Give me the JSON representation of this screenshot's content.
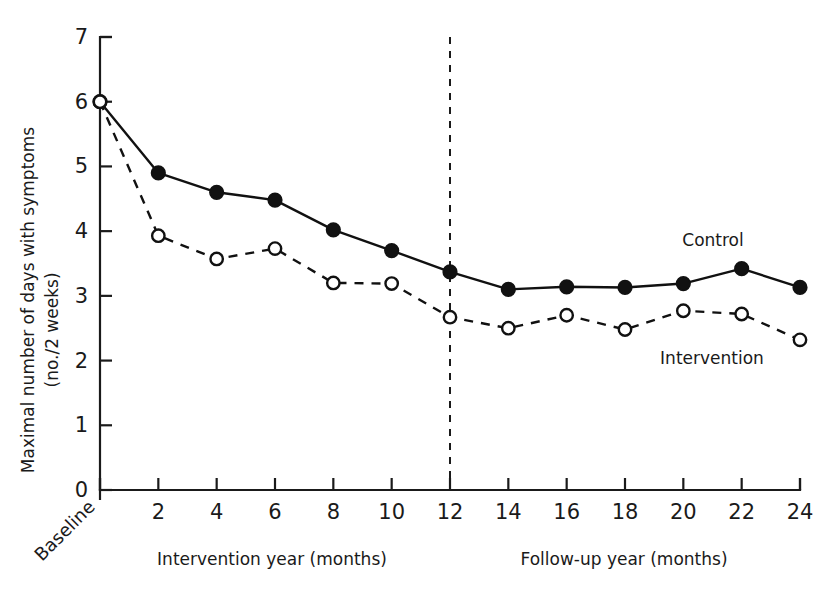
{
  "chart_data": {
    "type": "line",
    "title": "",
    "xlabel": "",
    "ylabel": "Maximal number of days with symptoms (no./2 weeks)",
    "ylabel_line1": "Maximal number of days with symptoms",
    "ylabel_line2": "(no./2 weeks)",
    "ylim": [
      0,
      7
    ],
    "yticks": [
      0,
      1,
      2,
      3,
      4,
      5,
      6,
      7
    ],
    "ytick_labels": [
      "0",
      "1",
      "2",
      "3",
      "4",
      "5",
      "6",
      "7"
    ],
    "xlim": [
      0,
      24
    ],
    "xticks": [
      0,
      2,
      4,
      6,
      8,
      10,
      12,
      14,
      16,
      18,
      20,
      22,
      24
    ],
    "xtick_labels": [
      "Baseline",
      "2",
      "4",
      "6",
      "8",
      "10",
      "12",
      "14",
      "16",
      "18",
      "20",
      "22",
      "24"
    ],
    "x": [
      0,
      2,
      4,
      6,
      8,
      10,
      12,
      14,
      16,
      18,
      20,
      22,
      24
    ],
    "grid": false,
    "legend_position": "inline-right",
    "series": [
      {
        "name": "Control",
        "marker": "filled-circle",
        "line_style": "solid",
        "color": "#111111",
        "values": [
          6.0,
          4.9,
          4.6,
          4.48,
          4.02,
          3.7,
          3.37,
          3.1,
          3.14,
          3.13,
          3.19,
          3.42,
          3.13
        ]
      },
      {
        "name": "Intervention",
        "marker": "open-circle",
        "line_style": "dashed",
        "color": "#111111",
        "values": [
          6.0,
          3.93,
          3.57,
          3.73,
          3.2,
          3.19,
          2.67,
          2.5,
          2.7,
          2.48,
          2.77,
          2.72,
          2.32
        ]
      }
    ],
    "annotations": [
      {
        "text": "Control",
        "x": 21.0,
        "y": 3.95
      },
      {
        "text": "Intervention",
        "x": 20.6,
        "y": 1.85
      }
    ],
    "x_axis_segments": [
      {
        "label": "Intervention year (months)",
        "from": 0,
        "to": 12
      },
      {
        "label": "Follow-up year (months)",
        "from": 12,
        "to": 24
      }
    ],
    "divider": {
      "at_x": 12,
      "style": "dashed"
    }
  },
  "labels": {
    "baseline": "Baseline",
    "intervention_axis": "Intervention year (months)",
    "followup_axis": "Follow-up year (months)",
    "control_series": "Control",
    "intervention_series": "Intervention",
    "ylabel_line1": "Maximal number of days with symptoms",
    "ylabel_line2": "(no./2 weeks)"
  },
  "ytick_labels": [
    "0",
    "1",
    "2",
    "3",
    "4",
    "5",
    "6",
    "7"
  ],
  "xtick_labels": [
    "2",
    "4",
    "6",
    "8",
    "10",
    "12",
    "14",
    "16",
    "18",
    "20",
    "22",
    "24"
  ],
  "colors": {
    "ink": "#111111",
    "background": "#ffffff"
  }
}
